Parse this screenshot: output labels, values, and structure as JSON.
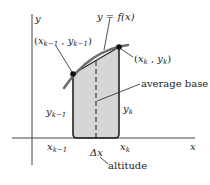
{
  "figure": {
    "type": "trapezoid-rule-illustration",
    "axes": {
      "x_label": "x",
      "y_label": "y"
    },
    "curve_label": "y = f(x)",
    "points": [
      {
        "id": "left",
        "label": "(x_{k-1}, y_{k-1})",
        "x_text": "x",
        "x_sub": "k−1",
        "y_text": "y",
        "y_sub": "k−1"
      },
      {
        "id": "right",
        "label": "(x_k, y_k)",
        "x_text": "x",
        "x_sub": "k",
        "y_text": "y",
        "y_sub": "k"
      }
    ],
    "annotations": {
      "average_base": "average base",
      "altitude": "altitude",
      "delta_x": "Δx"
    },
    "side_labels": {
      "left_height": {
        "main": "y",
        "sub": "k−1"
      },
      "right_height": {
        "main": "y",
        "sub": "k"
      },
      "left_tick": {
        "main": "x",
        "sub": "k−1"
      },
      "right_tick": {
        "main": "x",
        "sub": "k"
      }
    },
    "colors": {
      "fill": "#d6d6d6",
      "curve": "#6e6e6e",
      "ink": "#222222"
    }
  }
}
